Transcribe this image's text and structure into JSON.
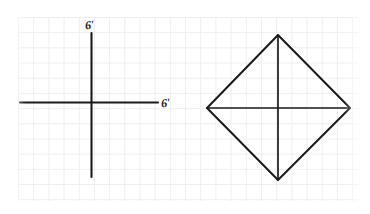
{
  "image": {
    "kind": "hand-drawn geometry worksheet scan",
    "width": 370,
    "height": 214,
    "background_color": "#ffffff",
    "grid_color": "#ececec",
    "ink_color": "#1a1a1a"
  },
  "labels": {
    "y_axis": "6'",
    "x_axis": "6'"
  },
  "chart_data": {
    "type": "scatter",
    "title": "",
    "subtitle": "",
    "xlabel": "6'",
    "ylabel": "6'",
    "grid": true,
    "legend": "none",
    "xlim": [
      0,
      370
    ],
    "ylim": [
      0,
      214
    ],
    "annotations": [
      "6'",
      "6'"
    ],
    "figures": [
      {
        "name": "coordinate-axes",
        "shape": "cross",
        "origin": [
          91,
          102
        ],
        "x_axis_extent": [
          20,
          158
        ],
        "y_axis_extent": [
          33,
          177
        ]
      },
      {
        "name": "rhombus",
        "shape": "polygon",
        "vertices": [
          [
            278,
            35
          ],
          [
            350,
            108
          ],
          [
            278,
            180
          ],
          [
            207,
            108
          ]
        ],
        "diagonals": [
          [
            [
              278,
              35
            ],
            [
              278,
              180
            ]
          ],
          [
            [
              207,
              108
            ],
            [
              350,
              108
            ]
          ]
        ],
        "diagonal_lengths_px": [
          145,
          143
        ],
        "center": [
          278,
          108
        ]
      }
    ]
  }
}
